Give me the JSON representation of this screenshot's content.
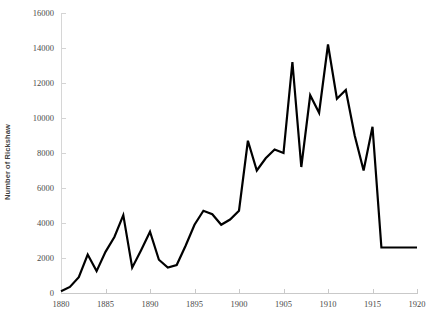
{
  "chart_data": {
    "type": "line",
    "title": "",
    "xlabel": "",
    "ylabel": "Number of Rickshaw",
    "xlim": [
      1880,
      1920
    ],
    "ylim": [
      0,
      16000
    ],
    "ytick_step": 2000,
    "xtick_step": 5,
    "grid": false,
    "legend": null,
    "line_color": "#000000",
    "line_width": 2.2,
    "axis_color": "#d0d0d0",
    "tick_label_color": "#4a4a4a",
    "yticks": [
      0,
      2000,
      4000,
      6000,
      8000,
      10000,
      12000,
      14000,
      16000
    ],
    "ytick_labels": [
      "0",
      "2000",
      "4000",
      "6000",
      "8000",
      "10000",
      "12000",
      "14000",
      "16000"
    ],
    "xticks": [
      1880,
      1885,
      1890,
      1895,
      1900,
      1905,
      1910,
      1915,
      1920
    ],
    "xtick_labels": [
      "1880",
      "1885",
      "1890",
      "1895",
      "1900",
      "1905",
      "1910",
      "1915",
      "1920"
    ],
    "x": [
      1880,
      1881,
      1882,
      1883,
      1884,
      1885,
      1886,
      1887,
      1888,
      1889,
      1890,
      1891,
      1892,
      1893,
      1894,
      1895,
      1896,
      1897,
      1898,
      1899,
      1900,
      1901,
      1902,
      1903,
      1904,
      1905,
      1906,
      1907,
      1908,
      1909,
      1910,
      1911,
      1912,
      1913,
      1914,
      1915,
      1916,
      1917,
      1918,
      1919,
      1920
    ],
    "values": [
      100,
      350,
      900,
      2200,
      1250,
      2350,
      3200,
      4450,
      1450,
      2450,
      3500,
      1900,
      1450,
      1600,
      2700,
      3900,
      4700,
      4500,
      3900,
      4200,
      4700,
      8700,
      7000,
      7700,
      8200,
      8000,
      13200,
      7200,
      11300,
      10300,
      14200,
      11100,
      11600,
      9000,
      7000,
      9500,
      2600,
      2600,
      2600,
      2600,
      2600
    ],
    "series_name": "Number of Rickshaw"
  }
}
